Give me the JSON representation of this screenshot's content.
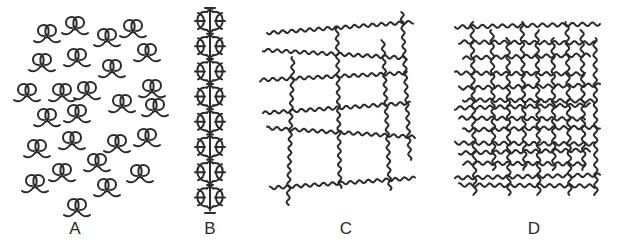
{
  "figure": {
    "stroke_color": "#2b2b2b",
    "background_color": "#ffffff",
    "panels": [
      {
        "id": "A",
        "label": "A",
        "content": "isolated coiled chains",
        "coil_count": 26
      },
      {
        "id": "B",
        "label": "B",
        "content": "aligned chain column",
        "unit_count": 8
      },
      {
        "id": "C",
        "label": "C",
        "content": "loosely cross-linked network"
      },
      {
        "id": "D",
        "label": "D",
        "content": "densely cross-linked network"
      }
    ]
  }
}
